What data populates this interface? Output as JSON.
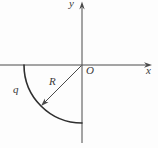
{
  "diagram": {
    "labels": {
      "y_axis": "y",
      "x_axis": "x",
      "origin": "O",
      "radius": "R",
      "charge": "q"
    },
    "colors": {
      "axis": "#4a4a4a",
      "arc": "#2f2f2f",
      "label": "#3a3a3a",
      "background": "#fdfdfd"
    }
  }
}
